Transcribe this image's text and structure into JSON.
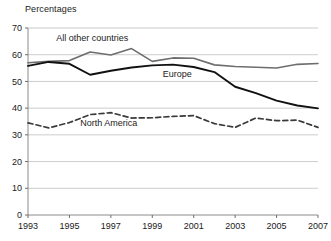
{
  "chart_data": {
    "type": "line",
    "title": "Percentages",
    "xlabel": "",
    "ylabel": "",
    "xlim": [
      1993,
      2007
    ],
    "ylim": [
      0,
      70
    ],
    "ytick_step": 10,
    "yticks": [
      "0",
      "10",
      "20",
      "30",
      "40",
      "50",
      "60",
      "70"
    ],
    "xticks": [
      "1993",
      "1995",
      "1997",
      "1999",
      "2001",
      "2003",
      "2005",
      "2007"
    ],
    "x": [
      1993,
      1994,
      1995,
      1996,
      1997,
      1998,
      1999,
      2000,
      2001,
      2002,
      2003,
      2004,
      2005,
      2006,
      2007
    ],
    "grid": "horizontal",
    "legend_position": "inline-labels",
    "series": [
      {
        "name": "All other countries",
        "color": "#6e6e6e",
        "style": "solid",
        "width": 1.6,
        "label_x": 1996.1,
        "label_y": 65.2,
        "values": [
          57.0,
          57.5,
          57.8,
          61.0,
          59.9,
          62.3,
          57.5,
          58.8,
          58.7,
          56.2,
          55.6,
          55.3,
          55.0,
          56.4,
          56.7
        ]
      },
      {
        "name": "Europe",
        "color": "#111111",
        "style": "solid",
        "width": 1.9,
        "label_x": 2000.2,
        "label_y": 51.6,
        "values": [
          55.8,
          57.3,
          56.6,
          52.5,
          54.0,
          55.2,
          56.0,
          56.3,
          55.4,
          53.5,
          48.0,
          45.6,
          42.8,
          41.0,
          39.9
        ]
      },
      {
        "name": "North America",
        "color": "#3a3a3a",
        "style": "dashed",
        "width": 1.7,
        "label_x": 1996.9,
        "label_y": 33.2,
        "values": [
          34.5,
          32.6,
          34.6,
          37.6,
          38.3,
          36.3,
          36.4,
          36.9,
          37.2,
          34.2,
          32.8,
          36.3,
          35.3,
          35.5,
          32.8
        ]
      }
    ]
  }
}
